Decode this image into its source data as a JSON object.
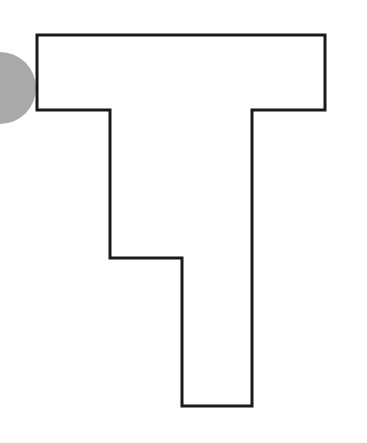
{
  "figure": {
    "width": 367,
    "height": 443,
    "background": "#ffffff",
    "circle": {
      "cx": 0,
      "cy": 88,
      "r": 36,
      "fill": "#a9a9a9"
    },
    "outline_shape": {
      "stroke": "#1a1a1a",
      "stroke_width": 3,
      "fill": "#ffffff",
      "points": "37,35 325,35 325,110 252,110 252,406 182,406 182,258 110,258 110,110 37,110"
    }
  }
}
